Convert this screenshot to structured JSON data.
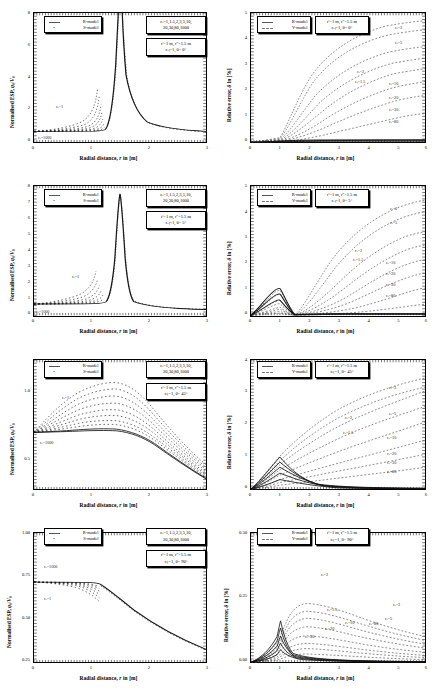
{
  "figure": {
    "layout": "4 rows x 2 columns of XY line/scatter plots",
    "rows": 4,
    "columns": 2
  },
  "axis_titles": {
    "x": "Radial distance, r in [m]",
    "y_left": "Normalised ESP, φ₀/V₀",
    "y_right": "Relative error, δ in [%]"
  },
  "legends": {
    "left": [
      {
        "label": "R-model",
        "style": "line"
      },
      {
        "label": "S-model",
        "style": "dots"
      }
    ],
    "right": [
      {
        "label": "R-model",
        "style": "line"
      },
      {
        "label": "V-model",
        "style": "dashed"
      }
    ]
  },
  "param_box_left": {
    "line1": "εᵣ=1,1.5,2,3,5,10,",
    "line2": "20,30,80,1000"
  },
  "geometry_lines": {
    "line1": "r'=1 m, r''=1.5 m"
  },
  "chart_data": [
    {
      "id": "r1c1",
      "type": "line",
      "title": "",
      "xlabel": "Radial distance, r in [m]",
      "ylabel": "Normalised ESP, φ₀/V₀",
      "xlim": [
        0,
        3
      ],
      "ylim": [
        0,
        8
      ],
      "xticks": [
        "0",
        "1",
        "2",
        "3"
      ],
      "yticks": [
        "0",
        "2",
        "4",
        "6",
        "8"
      ],
      "grid": false,
      "legend_position": "top-left",
      "theta": "θ= 0°",
      "params": [
        "r'=1 m, r''=1.5 m",
        "εᵣₜ=1, θ= 0°"
      ],
      "annotations": [
        {
          "text": "εᵣ=1",
          "x": 0.62,
          "y": 2.3
        },
        {
          "text": "εᵣ=1000",
          "x": 0.18,
          "y": 0.35
        }
      ],
      "series": [
        {
          "name": "εᵣ=1",
          "style": "dots",
          "peak_x": 1.5,
          "baseline": 0.667,
          "asymptote": 8
        },
        {
          "name": "εᵣ=1000",
          "style": "line",
          "peak_x": 1.5,
          "baseline": 0.667,
          "asymptote": 8
        }
      ],
      "description": "Singularity at r=1.5 m; curves diverge upward; family spread between r=0 and r=1."
    },
    {
      "id": "r1c2",
      "type": "line",
      "xlabel": "Radial distance, r in [m]",
      "ylabel": "Relative error, δ in [%]",
      "xlim": [
        0,
        6
      ],
      "ylim": [
        0,
        5
      ],
      "xticks": [
        "0",
        "1",
        "2",
        "3",
        "4",
        "5",
        "6"
      ],
      "yticks": [
        "0",
        "1",
        "2",
        "3",
        "4",
        "5"
      ],
      "grid": false,
      "legend_position": "top-left",
      "params": [
        "r'=1 m, r''=1.5 m",
        "εᵣₜ=1, θ= 0°"
      ],
      "curve_labels": [
        {
          "text": "εᵣ=3",
          "x": 5.55,
          "y": 4.45
        },
        {
          "text": "εᵣ=5",
          "x": 5.55,
          "y": 3.85
        },
        {
          "text": "εᵣ=2",
          "x": 4.25,
          "y": 2.7
        },
        {
          "text": "εᵣ=1.5",
          "x": 4.25,
          "y": 2.3
        },
        {
          "text": "εᵣ=10",
          "x": 5.35,
          "y": 2.25
        },
        {
          "text": "εᵣ=20",
          "x": 5.35,
          "y": 1.7
        },
        {
          "text": "εᵣ=30",
          "x": 5.35,
          "y": 1.25
        },
        {
          "text": "εᵣ=80",
          "x": 5.35,
          "y": 0.8
        }
      ],
      "series": [
        {
          "name": "εᵣ=3",
          "style": "dashed",
          "value_at_6": 4.6
        },
        {
          "name": "εᵣ=5",
          "style": "dashed",
          "value_at_6": 4.0
        },
        {
          "name": "εᵣ=2",
          "style": "dashed",
          "value_at_6": 2.9
        },
        {
          "name": "εᵣ=1.5",
          "style": "dashed",
          "value_at_6": 2.4
        },
        {
          "name": "εᵣ=10",
          "style": "dashed",
          "value_at_6": 2.35
        },
        {
          "name": "εᵣ=20",
          "style": "dashed",
          "value_at_6": 1.8
        },
        {
          "name": "εᵣ=30",
          "style": "dashed",
          "value_at_6": 1.35
        },
        {
          "name": "εᵣ=80",
          "style": "dashed",
          "value_at_6": 0.9
        }
      ],
      "description": "Error rises from 0 at r=0, near-zero hump before r=1.5, then monotonic growth to r=6."
    },
    {
      "id": "r2c1",
      "type": "line",
      "xlabel": "Radial distance, r in [m]",
      "ylabel": "Normalised ESP, φ₀/V₀",
      "xlim": [
        0,
        3
      ],
      "ylim": [
        0,
        8
      ],
      "xticks": [
        "0",
        "1",
        "2",
        "3"
      ],
      "yticks": [
        "0",
        "1",
        "2",
        "3",
        "4",
        "5",
        "6",
        "7",
        "8"
      ],
      "grid": false,
      "legend_position": "top-left",
      "params": [
        "r'=1 m, r''=1.5 m",
        "εᵣₜ=1, θ= 5°"
      ],
      "annotations": [
        {
          "text": "εᵣ=1",
          "x": 0.78,
          "y": 2.55
        },
        {
          "text": "εᵣ=1000",
          "x": 0.12,
          "y": 0.32
        }
      ],
      "series": [
        {
          "name": "εᵣ family",
          "style": "dots+line",
          "peak_x": 1.5,
          "peak_y": 7.5,
          "baseline": 0.7
        }
      ],
      "description": "Sharp finite peak ≈ 7.5 at r=1.5 m, decaying to ≈0.7 at r=3."
    },
    {
      "id": "r2c2",
      "type": "line",
      "xlabel": "Radial distance, r in [m]",
      "ylabel": "Relative error, δ in [%]",
      "xlim": [
        0,
        6
      ],
      "ylim": [
        0,
        5
      ],
      "xticks": [
        "0",
        "1",
        "2",
        "3",
        "4",
        "5",
        "6"
      ],
      "yticks": [
        "0",
        "1",
        "2",
        "3",
        "4",
        "5"
      ],
      "grid": false,
      "legend_position": "top-left",
      "params": [
        "r'=1 m, r''=1.5 m",
        "εᵣₜ=1, θ= 5°"
      ],
      "curve_labels": [
        {
          "text": "εᵣ=3",
          "x": 5.4,
          "y": 4.15
        },
        {
          "text": "εᵣ=5",
          "x": 5.4,
          "y": 3.55
        },
        {
          "text": "εᵣ=2",
          "x": 4.2,
          "y": 2.45
        },
        {
          "text": "εᵣ=1.5",
          "x": 4.2,
          "y": 2.1
        },
        {
          "text": "εᵣ=10",
          "x": 5.25,
          "y": 2.0
        },
        {
          "text": "εᵣ=20",
          "x": 5.25,
          "y": 1.55
        },
        {
          "text": "εᵣ=30",
          "x": 5.25,
          "y": 1.15
        },
        {
          "text": "εᵣ=80",
          "x": 5.25,
          "y": 0.72
        }
      ],
      "series": [
        {
          "name": "εᵣ=3",
          "style": "dashed",
          "value_at_6": 4.3
        },
        {
          "name": "εᵣ=5",
          "style": "dashed",
          "value_at_6": 3.7
        },
        {
          "name": "εᵣ=2",
          "style": "dashed",
          "value_at_6": 2.6
        },
        {
          "name": "εᵣ=1.5",
          "style": "dashed",
          "value_at_6": 2.2
        },
        {
          "name": "εᵣ=10",
          "style": "dashed",
          "value_at_6": 2.1
        },
        {
          "name": "εᵣ=20",
          "style": "dashed",
          "value_at_6": 1.6
        },
        {
          "name": "εᵣ=30",
          "style": "dashed",
          "value_at_6": 1.2
        },
        {
          "name": "εᵣ=80",
          "style": "dashed",
          "value_at_6": 0.8
        }
      ],
      "description": "Local hump peaking ≈1.0 near r=1, dip at r=1.5, then monotonic rise."
    },
    {
      "id": "r3c1",
      "type": "line",
      "xlabel": "Radial distance, r in [m]",
      "ylabel": "Normalised ESP, φ₀/V₀",
      "xlim": [
        0,
        3
      ],
      "ylim": [
        0.5,
        1.0
      ],
      "xticks": [
        "0",
        "1",
        "2",
        "3"
      ],
      "yticks": [
        "0.5",
        "1.0"
      ],
      "grid": false,
      "legend_position": "top-left",
      "params": [
        "r'=1 m, r''=1.5 m",
        "εᵣₜ=1, θ= 45°"
      ],
      "annotations": [
        {
          "text": "εᵣ=1",
          "x": 0.52,
          "y": 0.925
        },
        {
          "text": "εᵣ=1000",
          "x": 0.12,
          "y": 0.645
        }
      ],
      "series": [
        {
          "name": "εᵣ=1",
          "style": "dots",
          "peak_x": 1.3,
          "peak_y": 0.945,
          "end_y": 0.6
        },
        {
          "name": "εᵣ=1000",
          "style": "line",
          "peak_x": 1.3,
          "peak_y": 0.8,
          "end_y": 0.55
        }
      ],
      "description": "Broad smooth hump centred near r=1.3 m, family fans out then converges, falls to ~0.55 at r=3."
    },
    {
      "id": "r3c2",
      "type": "line",
      "xlabel": "Radial distance, r in [m]",
      "ylabel": "Relative error, δ in [%]",
      "xlim": [
        0,
        6
      ],
      "ylim": [
        0,
        4
      ],
      "xticks": [
        "0",
        "1",
        "2",
        "3",
        "4",
        "5",
        "6"
      ],
      "yticks": [
        "0",
        "1",
        "2",
        "3",
        "4"
      ],
      "grid": false,
      "legend_position": "top-left",
      "params": [
        "r'=1 m, r''=1.5 m",
        "εᵣₜ=1, θ= 45°"
      ],
      "curve_labels": [
        {
          "text": "εᵣ=3",
          "x": 5.35,
          "y": 3.35
        },
        {
          "text": "εᵣ=5",
          "x": 5.35,
          "y": 2.55
        },
        {
          "text": "εᵣ=2",
          "x": 3.75,
          "y": 2.3
        },
        {
          "text": "εᵣ=1.5",
          "x": 3.75,
          "y": 1.85
        },
        {
          "text": "εᵣ=10",
          "x": 5.3,
          "y": 1.6
        },
        {
          "text": "εᵣ=20",
          "x": 5.3,
          "y": 1.1
        },
        {
          "text": "εᵣ=30",
          "x": 5.3,
          "y": 0.82
        },
        {
          "text": "εᵣ=80",
          "x": 5.3,
          "y": 0.55
        }
      ],
      "series": [
        {
          "name": "εᵣ=3",
          "style": "dashed",
          "value_at_6": 3.3
        },
        {
          "name": "εᵣ=5",
          "style": "dashed",
          "value_at_6": 2.75
        },
        {
          "name": "εᵣ=2",
          "style": "dashed",
          "value_at_6": 2.6
        },
        {
          "name": "εᵣ=1.5",
          "style": "dashed",
          "value_at_6": 2.0
        },
        {
          "name": "εᵣ=10",
          "style": "dashed",
          "value_at_6": 1.7
        },
        {
          "name": "εᵣ=20",
          "style": "dashed",
          "value_at_6": 1.15
        },
        {
          "name": "εᵣ=30",
          "style": "dashed",
          "value_at_6": 0.85
        },
        {
          "name": "εᵣ=80",
          "style": "dashed",
          "value_at_6": 0.6
        }
      ],
      "description": "Cusp at r=1 reaching ≈1.0, R-model curves decay to ~0.1, V-model dashed curves rise steadily."
    },
    {
      "id": "r4c1",
      "type": "line",
      "xlabel": "Radial distance, r in [m]",
      "ylabel": "Normalised ESP, φ₀/V₀",
      "xlim": [
        0,
        3
      ],
      "ylim": [
        0.25,
        1.0
      ],
      "xticks": [
        "0",
        "1",
        "2",
        "3"
      ],
      "yticks": [
        "0.25",
        "0.50",
        "0.75",
        "1.00"
      ],
      "grid": false,
      "legend_position": "top-left",
      "params": [
        "r'=1 m, r''=1.5 m",
        "εᵣₜ=1, θ= 90°"
      ],
      "annotations": [
        {
          "text": "εᵣ=1000",
          "x": 0.3,
          "y": 0.775
        },
        {
          "text": "εᵣ=1",
          "x": 0.3,
          "y": 0.6
        }
      ],
      "series": [
        {
          "name": "εᵣ family",
          "style": "dots+line",
          "plateau_y": 0.7,
          "end_y": 0.3
        }
      ],
      "description": "Flat plateau ≈0.70 up to r≈1, then monotonic decay to ≈0.30 at r=3."
    },
    {
      "id": "r4c2",
      "type": "line",
      "xlabel": "Radial distance, r in [m]",
      "ylabel": "Relative error, δ in [%]",
      "xlim": [
        0,
        6
      ],
      "ylim": [
        0,
        0.5
      ],
      "xticks": [
        "0",
        "1",
        "2",
        "3",
        "4",
        "5",
        "6"
      ],
      "yticks": [
        "0.00",
        "0.25",
        "0.50"
      ],
      "grid": false,
      "legend_position": "top-left",
      "params": [
        "r'=1 m, r''=1.5 m",
        "εᵣₜ=1, θ= 90°"
      ],
      "curve_labels": [
        {
          "text": "εᵣ=2",
          "x": 2.85,
          "y": 0.345
        },
        {
          "text": "εᵣ=1.5",
          "x": 3.05,
          "y": 0.205
        },
        {
          "text": "εᵣ=10",
          "x": 3.65,
          "y": 0.125
        },
        {
          "text": "εᵣ=20",
          "x": 3.0,
          "y": 0.105
        },
        {
          "text": "εᵣ=30",
          "x": 2.35,
          "y": 0.075
        },
        {
          "text": "εᵣ=3",
          "x": 5.35,
          "y": 0.185
        },
        {
          "text": "εᵣ=5",
          "x": 5.05,
          "y": 0.13
        },
        {
          "text": "εᵣ=80",
          "x": 4.6,
          "y": 0.112
        }
      ],
      "series": [
        {
          "name": "εᵣ=2",
          "style": "dashed",
          "peak_x": 1.55,
          "peak_y": 0.33
        },
        {
          "name": "εᵣ=1.5",
          "style": "dashed",
          "peak_x": 1.5,
          "peak_y": 0.285
        },
        {
          "name": "εᵣ=3",
          "style": "dashed",
          "peak_x": 1.6,
          "peak_y": 0.26
        },
        {
          "name": "εᵣ=5",
          "style": "dashed",
          "peak_x": 1.6,
          "peak_y": 0.21
        },
        {
          "name": "εᵣ=10",
          "style": "dashed",
          "peak_x": 1.4,
          "peak_y": 0.15
        },
        {
          "name": "εᵣ=20",
          "style": "dashed",
          "peak_x": 1.3,
          "peak_y": 0.11
        },
        {
          "name": "εᵣ=30",
          "style": "dashed",
          "peak_x": 1.2,
          "peak_y": 0.085
        },
        {
          "name": "εᵣ=80",
          "style": "dashed",
          "peak_x": 1.1,
          "peak_y": 0.055
        }
      ],
      "description": "Humped curves peaking just after r=1.5 then slow decay; R-model spikes sharply at r=1."
    }
  ]
}
